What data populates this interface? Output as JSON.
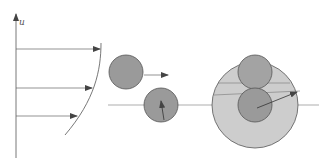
{
  "figure": {
    "axis_label": "u",
    "colors": {
      "line": "#555555",
      "particle_fill": "#9a9a9a",
      "particle_stroke": "#555555",
      "collision_sphere_fill": "#cdcdcd",
      "background": "#ffffff"
    },
    "panels": [
      {
        "id": "velocity-profile",
        "description": "Vertical axis u with three horizontal velocity arrows ending on a curved profile"
      },
      {
        "id": "particle-pair",
        "description": "Two particles in shear flow, upper moving right, lower on reference line"
      },
      {
        "id": "collision-sphere",
        "description": "Two touching particles inside a large light-grey collision sphere with crossing streamlines"
      }
    ]
  }
}
